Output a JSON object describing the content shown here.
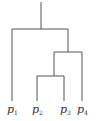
{
  "diagram": {
    "type": "dendrogram",
    "line_color": "#555555",
    "leaves": [
      {
        "label": "p",
        "sub": "1"
      },
      {
        "label": "p",
        "sub": "2"
      },
      {
        "label": "p",
        "sub": "3"
      },
      {
        "label": "p",
        "sub": "4"
      }
    ],
    "merges": [
      {
        "children": [
          "p2",
          "p3"
        ],
        "level": 3
      },
      {
        "children": [
          "(p2,p3)",
          "p4"
        ],
        "level": 2
      },
      {
        "children": [
          "p1",
          "((p2,p3),p4)"
        ],
        "level": 1
      }
    ]
  }
}
